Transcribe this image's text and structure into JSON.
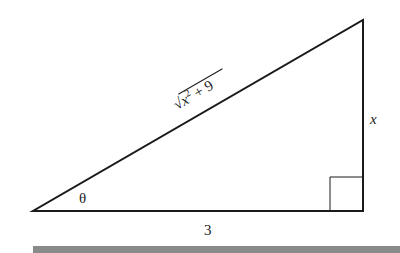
{
  "diagram": {
    "type": "right-triangle",
    "labels": {
      "hypotenuse": "√x² + 9",
      "hyp_radicand_base": "x",
      "hyp_exponent": "2",
      "hyp_rest": " + 9",
      "opposite": "x",
      "adjacent": "3",
      "angle": "θ"
    },
    "colors": {
      "line": "#1a1a1a",
      "bar": "#8a8a8a"
    }
  }
}
